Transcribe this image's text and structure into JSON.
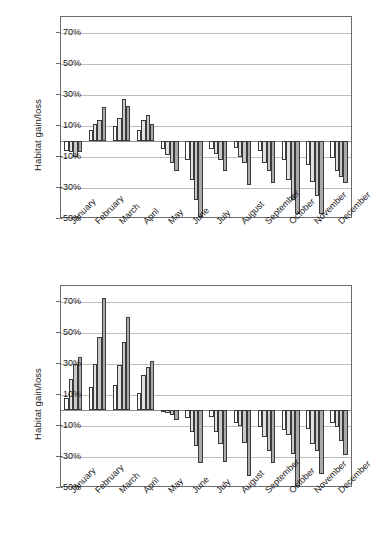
{
  "figure": {
    "title": "",
    "background": "#ffffff"
  },
  "chart_data": [
    {
      "id": "top-chart",
      "type": "bar",
      "title": "",
      "xlabel": "",
      "ylabel": "Habitat gain/loss",
      "ylim": [
        -50,
        80
      ],
      "yticks": [
        70,
        50,
        30,
        10,
        -10,
        -30,
        -50
      ],
      "ytick_labels": [
        "70%",
        "50%",
        "30%",
        "10%",
        "-10%",
        "-30%",
        "-50%"
      ],
      "grid": true,
      "legend": "none",
      "categories": [
        "January",
        "February",
        "March",
        "April",
        "May",
        "June",
        "July",
        "August",
        "September",
        "October",
        "November",
        "December"
      ],
      "series": [
        {
          "name": "series-1",
          "color": "#ffffff",
          "values": [
            -6,
            7,
            10,
            7,
            -5,
            -12,
            -5,
            -4,
            -6,
            -12,
            -15,
            -11
          ]
        },
        {
          "name": "series-2",
          "color": "#e2e2e2",
          "values": [
            -7,
            11,
            15,
            14,
            -9,
            -25,
            -8,
            -10,
            -14,
            -25,
            -26,
            -19
          ]
        },
        {
          "name": "series-3",
          "color": "#c9c9c9",
          "values": [
            -10,
            14,
            27,
            17,
            -14,
            -38,
            -12,
            -14,
            -19,
            -38,
            -35,
            -23
          ]
        },
        {
          "name": "series-4",
          "color": "#a9a9a9",
          "values": [
            -7,
            22,
            23,
            11,
            -19,
            -49,
            -19,
            -28,
            -27,
            -47,
            -47,
            -27
          ]
        }
      ]
    },
    {
      "id": "bottom-chart",
      "type": "bar",
      "title": "",
      "xlabel": "",
      "ylabel": "Habitat gain/loss",
      "ylim": [
        -50,
        80
      ],
      "yticks": [
        70,
        50,
        30,
        10,
        -10,
        -30,
        -50
      ],
      "ytick_labels": [
        "70%",
        "50%",
        "30%",
        "10%",
        "-10%",
        "-30%",
        "-50%"
      ],
      "grid": true,
      "legend": "none",
      "categories": [
        "January",
        "February",
        "March",
        "April",
        "May",
        "June",
        "July",
        "August",
        "September",
        "October",
        "November",
        "December"
      ],
      "series": [
        {
          "name": "series-1",
          "color": "#ffffff",
          "values": [
            8,
            15,
            16,
            11,
            -1,
            -5,
            -4,
            -8,
            -11,
            -13,
            -12,
            -8
          ]
        },
        {
          "name": "series-2",
          "color": "#e2e2e2",
          "values": [
            20,
            30,
            29,
            23,
            -2,
            -14,
            -14,
            -10,
            -17,
            -16,
            -22,
            -11
          ]
        },
        {
          "name": "series-3",
          "color": "#c9c9c9",
          "values": [
            30,
            47,
            44,
            28,
            -3,
            -23,
            -22,
            -21,
            -26,
            -28,
            -26,
            -20
          ]
        },
        {
          "name": "series-4",
          "color": "#a9a9a9",
          "values": [
            34,
            72,
            60,
            32,
            -6,
            -34,
            -33,
            -42,
            -34,
            -49,
            -41,
            -29
          ]
        }
      ]
    }
  ]
}
